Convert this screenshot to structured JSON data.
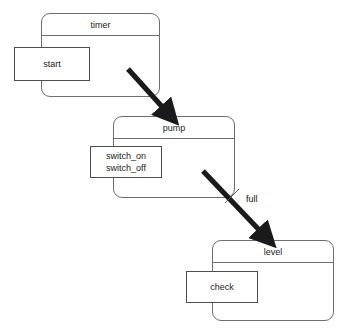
{
  "diagram": {
    "type": "component-state-diagram",
    "background_color": "#ffffff",
    "line_color": "#6e6e6e",
    "arrow_color": "#1a1a1a",
    "text_color": "#1a1a1a",
    "states": [
      {
        "id": "timer",
        "title": "timer",
        "ports": [
          {
            "id": "start",
            "labels": [
              "start"
            ]
          }
        ]
      },
      {
        "id": "pump",
        "title": "pump",
        "ports": [
          {
            "id": "switch",
            "labels": [
              "switch_on",
              "switch_off"
            ]
          }
        ]
      },
      {
        "id": "level",
        "title": "level",
        "ports": [
          {
            "id": "check",
            "labels": [
              "check"
            ]
          }
        ]
      }
    ],
    "edges": [
      {
        "id": "timer-to-pump",
        "from": "timer",
        "to": "pump",
        "label": ""
      },
      {
        "id": "pump-to-level",
        "from": "pump",
        "to": "level",
        "label": "full"
      }
    ]
  }
}
